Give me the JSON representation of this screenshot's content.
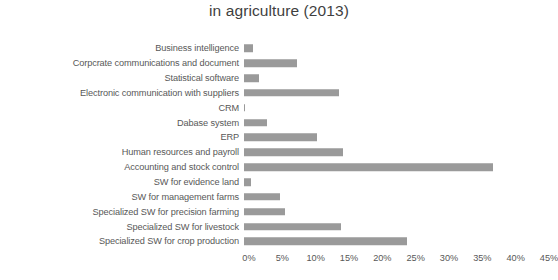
{
  "chart_data": {
    "type": "bar",
    "orientation": "horizontal",
    "title": "in agriculture (2013)",
    "title_clipped_above": "Use of software",
    "xlabel": "",
    "ylabel": "",
    "xlim": [
      0,
      45
    ],
    "x_unit": "%",
    "grid": false,
    "legend": null,
    "bar_color": "#9a9a9a",
    "tick_labels": [
      "0%",
      "5%",
      "10%",
      "15%",
      "20%",
      "25%",
      "30%",
      "35%",
      "40%",
      "45%"
    ],
    "tick_values": [
      0,
      5,
      10,
      15,
      20,
      25,
      30,
      35,
      40,
      45
    ],
    "categories": [
      "Business intelligence",
      "Corpcrate communications and document",
      "Statistical software",
      "Electronic communication with suppliers",
      "CRM",
      "Dabase system",
      "ERP",
      "Human resources and payroll",
      "Accounting and stock control",
      "SW for evidence land",
      "SW for management farms",
      "Specialized SW for precision farming",
      "Specialized SW for livestock",
      "Specialized SW for crop production"
    ],
    "values": [
      1.3,
      8.0,
      2.2,
      14.3,
      0.2,
      3.4,
      11.0,
      14.8,
      37.3,
      1.0,
      5.4,
      6.2,
      14.6,
      24.5
    ]
  }
}
